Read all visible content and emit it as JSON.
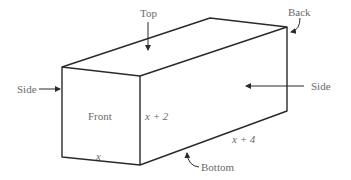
{
  "diagram": {
    "type": "rectangular-box",
    "labels": {
      "top": "Top",
      "back": "Back",
      "side_left": "Side",
      "side_right": "Side",
      "front": "Front",
      "bottom": "Bottom"
    },
    "dimensions": {
      "width": "x",
      "height": "x + 2",
      "depth": "x + 4"
    },
    "colors": {
      "line": "#2a2a2a",
      "text": "#6a6a6a"
    }
  }
}
